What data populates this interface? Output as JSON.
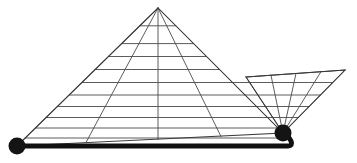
{
  "figure": {
    "canvas": {
      "width": 357,
      "height": 163,
      "background": "#ffffff"
    },
    "colors": {
      "background": "#ffffff",
      "thin_line": "#4a4a4a",
      "edge_line": "#3a3a3a",
      "thick_line": "#111111",
      "node_fill": "#141414"
    },
    "stroke_widths": {
      "thin_line": 0.9,
      "edge_line": 1.05,
      "baseline": 5.0
    }
  },
  "geometry": {
    "apex": {
      "label": "apex",
      "x": 158,
      "y": 8
    },
    "left_node": {
      "label": "left-node",
      "x": 17,
      "y": 146,
      "radius": 8.5
    },
    "right_node": {
      "label": "right-node",
      "x": 283,
      "y": 133,
      "radius": 8.5
    },
    "wing_far_top": {
      "label": "wing-far-top",
      "x": 345,
      "y": 70
    },
    "wing_near_top": {
      "label": "wing-near-top",
      "x": 246,
      "y": 77
    },
    "triangle_outline": "M158,8 L17,146 L283,133 Z",
    "wing_outline": "M246,77 L345,70 L283,133 Z",
    "baseline_path": "M17,146 L288,146 Q293,146 291,141 L286,133",
    "horizontal_rows": [
      {
        "index": 1,
        "y": 25.8
      },
      {
        "index": 2,
        "y": 43.6
      },
      {
        "index": 3,
        "y": 56.5
      },
      {
        "index": 4,
        "y": 69.5
      },
      {
        "index": 5,
        "y": 82.5
      },
      {
        "index": 6,
        "y": 95.0
      },
      {
        "index": 7,
        "y": 106.5
      },
      {
        "index": 8,
        "y": 117.5
      },
      {
        "index": 9,
        "y": 128.0
      },
      {
        "index": 10,
        "y": 138.0
      }
    ],
    "apex_rays": [
      {
        "index": 1,
        "name": "apex-ray-left-edge",
        "end_x": 17,
        "end_y": 146
      },
      {
        "index": 2,
        "name": "apex-ray-left-inner",
        "end_x": 86,
        "end_y": 142.5
      },
      {
        "index": 3,
        "name": "apex-ray-center",
        "end_x": 158,
        "end_y": 139.5
      },
      {
        "index": 4,
        "name": "apex-ray-right-inner",
        "end_x": 221,
        "end_y": 136.5
      },
      {
        "index": 5,
        "name": "apex-ray-right-edge",
        "end_x": 283,
        "end_y": 133
      }
    ],
    "wing_rays": [
      {
        "index": 1,
        "name": "wing-ray-1",
        "end_x": 246,
        "end_y": 77
      },
      {
        "index": 2,
        "name": "wing-ray-2",
        "end_x": 271,
        "end_y": 75.2
      },
      {
        "index": 3,
        "name": "wing-ray-3",
        "end_x": 296,
        "end_y": 73.4
      },
      {
        "index": 4,
        "name": "wing-ray-4",
        "end_x": 321,
        "end_y": 71.6
      },
      {
        "index": 5,
        "name": "wing-ray-5",
        "end_x": 345,
        "end_y": 70
      }
    ],
    "wing_horizontal_rows": [
      {
        "index": 1,
        "y": 82.5
      },
      {
        "index": 2,
        "y": 95.0
      },
      {
        "index": 3,
        "y": 106.5
      },
      {
        "index": 4,
        "y": 117.5
      },
      {
        "index": 5,
        "y": 128.0
      }
    ]
  },
  "elements": {
    "left_node_label": "left base node",
    "right_node_label": "right base node",
    "apex_label": "apex vertex",
    "baseline_label": "thick baseline"
  }
}
